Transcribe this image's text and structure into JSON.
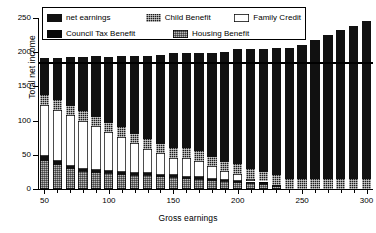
{
  "chart_data": {
    "type": "bar",
    "title": "",
    "subtitle": "",
    "xlabel": "Gross earnings",
    "ylabel": "Total net income",
    "stacked": true,
    "grid": false,
    "legend_position": "top-left inside plot",
    "xlim": [
      45,
      305
    ],
    "ylim": [
      0,
      250
    ],
    "yticks": [
      0,
      50,
      100,
      150,
      200,
      250
    ],
    "ytick_labels": [
      "0",
      "50",
      "100",
      "150",
      "200",
      "250"
    ],
    "xticks": [
      50,
      100,
      150,
      200,
      250,
      300
    ],
    "xtick_labels": [
      "50",
      "100",
      "150",
      "200",
      "250",
      "300"
    ],
    "x": [
      50,
      60,
      70,
      80,
      90,
      100,
      110,
      120,
      130,
      140,
      150,
      160,
      170,
      180,
      190,
      200,
      210,
      220,
      230,
      240,
      250,
      260,
      270,
      280,
      290,
      300
    ],
    "categories": [
      "50",
      "60",
      "70",
      "80",
      "90",
      "100",
      "110",
      "120",
      "130",
      "140",
      "150",
      "160",
      "170",
      "180",
      "190",
      "200",
      "210",
      "220",
      "230",
      "240",
      "250",
      "260",
      "270",
      "280",
      "290",
      "300"
    ],
    "series": [
      {
        "name": "Housing Benefit",
        "style": "light-dotted",
        "color": "#b9b9b9",
        "values": [
          42,
          36,
          30,
          26,
          25,
          23,
          22,
          21,
          20,
          19,
          18,
          16,
          15,
          13,
          11,
          10,
          9,
          7,
          5,
          0,
          0,
          0,
          0,
          0,
          0,
          0
        ]
      },
      {
        "name": "Council Tax Benefit",
        "style": "solid-black",
        "color": "#080808",
        "values": [
          6,
          5,
          4,
          3,
          3,
          3,
          3,
          3,
          3,
          2,
          2,
          2,
          2,
          2,
          2,
          2,
          2,
          2,
          1,
          0,
          0,
          0,
          0,
          0,
          0,
          0
        ]
      },
      {
        "name": "Family Credit",
        "style": "white-outline",
        "color": "#ffffff",
        "values": [
          75,
          75,
          74,
          71,
          64,
          57,
          51,
          43,
          36,
          31,
          26,
          28,
          24,
          18,
          13,
          10,
          4,
          2,
          0,
          0,
          0,
          0,
          0,
          0,
          0,
          0
        ]
      },
      {
        "name": "Child Benefit",
        "style": "dark-speckled",
        "color": "#1c1c1c",
        "values": [
          14,
          14,
          14,
          14,
          14,
          14,
          14,
          14,
          14,
          14,
          14,
          14,
          14,
          14,
          14,
          14,
          14,
          14,
          14,
          14,
          14,
          14,
          14,
          14,
          14,
          14
        ]
      },
      {
        "name": "net earnings",
        "style": "solid-black",
        "color": "#111111",
        "values": [
          54,
          62,
          71,
          79,
          88,
          96,
          104,
          113,
          122,
          130,
          139,
          139,
          144,
          152,
          160,
          168,
          175,
          180,
          186,
          192,
          197,
          204,
          211,
          218,
          225,
          231
        ]
      }
    ],
    "totals": [
      191,
      192,
      193,
      193,
      194,
      193,
      194,
      194,
      195,
      196,
      199,
      199,
      199,
      199,
      200,
      204,
      204,
      205,
      206,
      206,
      211,
      218,
      225,
      232,
      239,
      245
    ],
    "reference_line": {
      "value": 185,
      "orientation": "horizontal",
      "color": "#000000"
    }
  },
  "legend": {
    "items": [
      {
        "label": "net earnings",
        "swatch": "solid-black"
      },
      {
        "label": "Child Benefit",
        "swatch": "dark-speckled"
      },
      {
        "label": "Family Credit",
        "swatch": "white-outline"
      },
      {
        "label": "Council Tax Benefit",
        "swatch": "solid-black"
      },
      {
        "label": "Housing Benefit",
        "swatch": "light-dotted"
      }
    ]
  }
}
